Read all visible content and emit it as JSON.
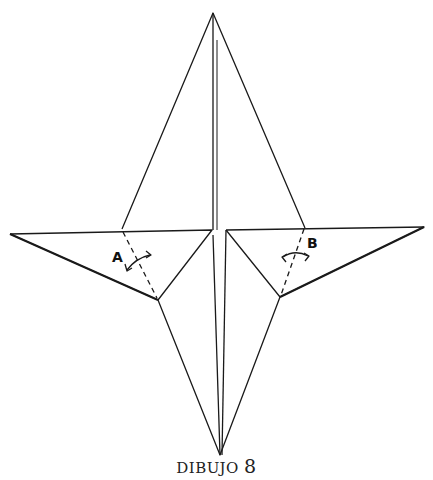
{
  "figure": {
    "caption_prefix": "DIBUJO",
    "caption_number": "8",
    "labels": {
      "a": "A",
      "b": "B"
    }
  }
}
